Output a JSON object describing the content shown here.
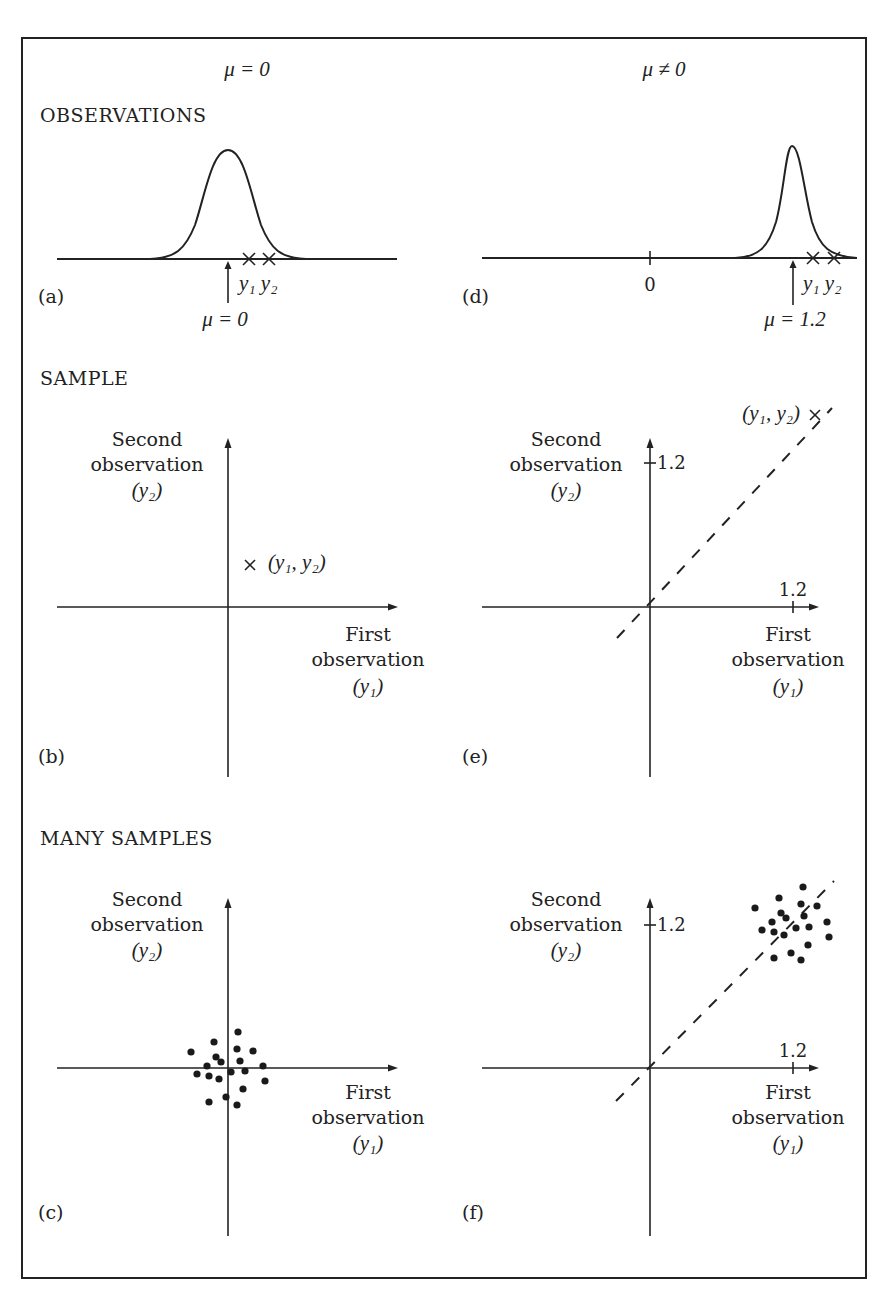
{
  "figure": {
    "columns": {
      "left_header": "μ = 0",
      "right_header": "μ ≠ 0"
    },
    "sections": {
      "observations": "OBSERVATIONS",
      "sample": "SAMPLE",
      "many_samples": "MANY SAMPLES"
    },
    "panels": {
      "a": {
        "label": "(a)",
        "obs_labels": "y₁ y₂",
        "mean_label": "μ = 0"
      },
      "b": {
        "label": "(b)",
        "y_axis_title": [
          "Second",
          "observation",
          "(y₂)"
        ],
        "x_axis_title": [
          "First",
          "observation",
          "(y₁)"
        ],
        "point_label": "(y₁, y₂)"
      },
      "c": {
        "label": "(c)",
        "y_axis_title": [
          "Second",
          "observation",
          "(y₂)"
        ],
        "x_axis_title": [
          "First",
          "observation",
          "(y₁)"
        ]
      },
      "d": {
        "label": "(d)",
        "zero_label": "0",
        "obs_labels": "y₁ y₂",
        "mean_label": "μ = 1.2"
      },
      "e": {
        "label": "(e)",
        "y_axis_title": [
          "Second",
          "observation",
          "(y₂)"
        ],
        "x_axis_title": [
          "First",
          "observation",
          "(y₁)"
        ],
        "y_tick": "1.2",
        "x_tick": "1.2",
        "point_label": "(y₁, y₂)"
      },
      "f": {
        "label": "(f)",
        "y_axis_title": [
          "Second",
          "observation",
          "(y₂)"
        ],
        "x_axis_title": [
          "First",
          "observation",
          "(y₁)"
        ],
        "y_tick": "1.2",
        "x_tick": "1.2"
      }
    },
    "colors": {
      "ink": "#222222",
      "background": "#ffffff"
    },
    "scatter": {
      "c_points_px": [
        [
          238,
          1032
        ],
        [
          214,
          1042
        ],
        [
          191,
          1052
        ],
        [
          237,
          1049
        ],
        [
          253,
          1051
        ],
        [
          216,
          1057
        ],
        [
          221,
          1062
        ],
        [
          240,
          1061
        ],
        [
          207,
          1066
        ],
        [
          263,
          1066
        ],
        [
          231,
          1072
        ],
        [
          245,
          1071
        ],
        [
          197,
          1074
        ],
        [
          209,
          1076
        ],
        [
          219,
          1079
        ],
        [
          265,
          1081
        ],
        [
          243,
          1089
        ],
        [
          226,
          1097
        ],
        [
          209,
          1102
        ],
        [
          237,
          1105
        ]
      ],
      "f_points_px": [
        [
          803,
          887
        ],
        [
          779,
          898
        ],
        [
          755,
          908
        ],
        [
          801,
          904
        ],
        [
          817,
          906
        ],
        [
          781,
          913
        ],
        [
          786,
          918
        ],
        [
          804,
          916
        ],
        [
          772,
          922
        ],
        [
          827,
          922
        ],
        [
          762,
          930
        ],
        [
          774,
          932
        ],
        [
          796,
          928
        ],
        [
          809,
          927
        ],
        [
          784,
          935
        ],
        [
          829,
          937
        ],
        [
          808,
          945
        ],
        [
          791,
          953
        ],
        [
          774,
          958
        ],
        [
          801,
          960
        ]
      ]
    }
  }
}
